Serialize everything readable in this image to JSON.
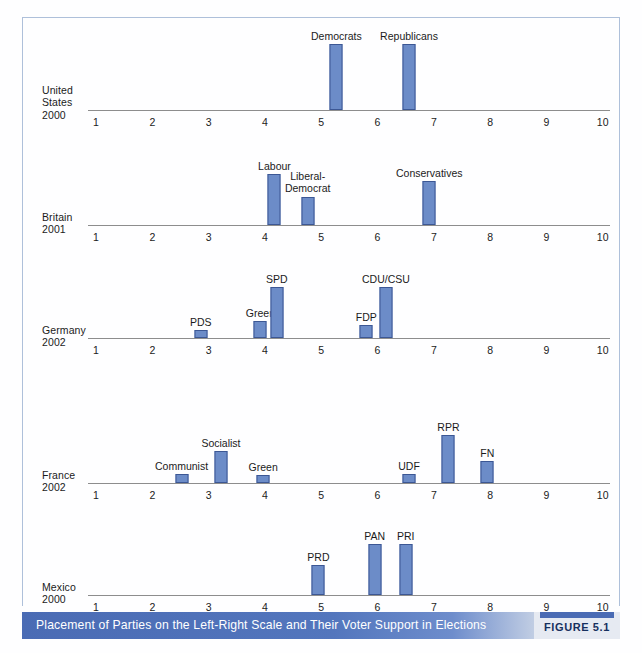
{
  "figure": {
    "caption": "Placement of Parties on the Left-Right Scale and Their Voter Support in Elections",
    "figure_tag": "FIGURE 5.1",
    "accent_color": "#4a6bb4",
    "bar_fill_color": "#6c8cc8",
    "bar_stroke_color": "#3c5794",
    "frame_color": "#aec0da",
    "axis_color": "#8d8d8d"
  },
  "chart_data": {
    "type": "bar",
    "title": "Placement of Parties on the Left-Right Scale and Their Voter Support in Elections",
    "xlabel": "Left-Right Scale",
    "ylabel": "Voter Support in Elections",
    "xlim": [
      1,
      10
    ],
    "grid": false,
    "legend": "none",
    "tick_labels": [
      "1",
      "2",
      "3",
      "4",
      "5",
      "6",
      "7",
      "8",
      "9",
      "10"
    ],
    "panels": [
      {
        "country": "United States",
        "country_line1": "United",
        "country_line2": "States",
        "year": "2000",
        "parties": [
          {
            "name": "Democrats",
            "x": 5.27,
            "support": 1.0
          },
          {
            "name": "Republicans",
            "x": 6.56,
            "support": 1.0
          }
        ]
      },
      {
        "country": "Britain",
        "country_line1": "Britain",
        "country_line2": "",
        "year": "2001",
        "parties": [
          {
            "name": "Labour",
            "x": 4.17,
            "support": 0.78
          },
          {
            "name": "Liberal-Democrat",
            "x": 4.76,
            "support": 0.42
          },
          {
            "name": "Conservatives",
            "x": 6.92,
            "support": 0.67
          }
        ]
      },
      {
        "country": "Germany",
        "country_line1": "Germany",
        "country_line2": "",
        "year": "2002",
        "parties": [
          {
            "name": "PDS",
            "x": 2.86,
            "support": 0.12
          },
          {
            "name": "Green",
            "x": 3.92,
            "support": 0.26
          },
          {
            "name": "SPD",
            "x": 4.21,
            "support": 0.78
          },
          {
            "name": "FDP",
            "x": 5.8,
            "support": 0.2
          },
          {
            "name": "CDU/CSU",
            "x": 6.15,
            "support": 0.77
          }
        ]
      },
      {
        "country": "France",
        "country_line1": "France",
        "country_line2": "",
        "year": "2002",
        "parties": [
          {
            "name": "Communist",
            "x": 2.52,
            "support": 0.13
          },
          {
            "name": "Socialist",
            "x": 3.22,
            "support": 0.49
          },
          {
            "name": "Green",
            "x": 3.97,
            "support": 0.12
          },
          {
            "name": "UDF",
            "x": 6.56,
            "support": 0.13
          },
          {
            "name": "RPR",
            "x": 7.26,
            "support": 0.72
          },
          {
            "name": "FN",
            "x": 7.95,
            "support": 0.33
          }
        ]
      },
      {
        "country": "Mexico",
        "country_line1": "Mexico",
        "country_line2": "",
        "year": "2000",
        "parties": [
          {
            "name": "PRD",
            "x": 4.95,
            "support": 0.45
          },
          {
            "name": "PAN",
            "x": 5.95,
            "support": 0.78
          },
          {
            "name": "PRI",
            "x": 6.5,
            "support": 0.78
          }
        ]
      }
    ]
  }
}
